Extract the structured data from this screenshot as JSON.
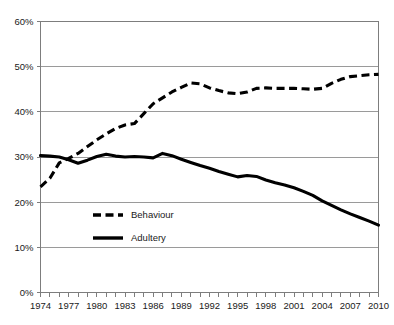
{
  "chart_data": {
    "type": "line",
    "title": "",
    "xlabel": "",
    "ylabel": "",
    "xlim": [
      1974,
      2010
    ],
    "ylim": [
      0,
      60
    ],
    "grid": true,
    "grid_axis": "y",
    "legend_position": "inside-lower-left",
    "x": [
      1974,
      1975,
      1976,
      1977,
      1978,
      1979,
      1980,
      1981,
      1982,
      1983,
      1984,
      1985,
      1986,
      1987,
      1988,
      1989,
      1990,
      1991,
      1992,
      1993,
      1994,
      1995,
      1996,
      1997,
      1998,
      1999,
      2000,
      2001,
      2002,
      2003,
      2004,
      2005,
      2006,
      2007,
      2008,
      2009,
      2010
    ],
    "series": [
      {
        "name": "Behaviour",
        "style": "dashed",
        "color": "#000000",
        "values": [
          23.4,
          25.3,
          28.7,
          29.7,
          30.8,
          32.3,
          33.8,
          35.1,
          36.3,
          37.1,
          37.4,
          39.6,
          41.8,
          43.1,
          44.4,
          45.4,
          46.4,
          46.2,
          45.3,
          44.7,
          44.2,
          44.0,
          44.4,
          45.2,
          45.3,
          45.2,
          45.2,
          45.2,
          45.1,
          45.0,
          45.2,
          46.3,
          47.2,
          47.8,
          48.0,
          48.2,
          48.3
        ]
      },
      {
        "name": "Adultery",
        "style": "solid",
        "color": "#000000",
        "values": [
          30.3,
          30.2,
          30.0,
          29.4,
          28.6,
          29.3,
          30.1,
          30.6,
          30.2,
          30.0,
          30.1,
          30.0,
          29.8,
          30.8,
          30.3,
          29.5,
          28.8,
          28.1,
          27.5,
          26.8,
          26.2,
          25.6,
          25.9,
          25.7,
          24.9,
          24.3,
          23.8,
          23.2,
          22.4,
          21.5,
          20.3,
          19.3,
          18.3,
          17.4,
          16.6,
          15.8,
          14.9
        ]
      }
    ],
    "yticks": [
      {
        "value": 0,
        "label": "0%"
      },
      {
        "value": 10,
        "label": "10%"
      },
      {
        "value": 20,
        "label": "20%"
      },
      {
        "value": 30,
        "label": "30%"
      },
      {
        "value": 40,
        "label": "40%"
      },
      {
        "value": 50,
        "label": "50%"
      },
      {
        "value": 60,
        "label": "60%"
      }
    ],
    "xticks_labeled": [
      {
        "value": 1974,
        "label": "1974"
      },
      {
        "value": 1977,
        "label": "1977"
      },
      {
        "value": 1980,
        "label": "1980"
      },
      {
        "value": 1983,
        "label": "1983"
      },
      {
        "value": 1986,
        "label": "1986"
      },
      {
        "value": 1989,
        "label": "1989"
      },
      {
        "value": 1992,
        "label": "1992"
      },
      {
        "value": 1995,
        "label": "1995"
      },
      {
        "value": 1998,
        "label": "1998"
      },
      {
        "value": 2001,
        "label": "2001"
      },
      {
        "value": 2004,
        "label": "2004"
      },
      {
        "value": 2007,
        "label": "2007"
      },
      {
        "value": 2010,
        "label": "2010"
      }
    ],
    "legend": [
      {
        "label": "Behaviour",
        "style": "dashed"
      },
      {
        "label": "Adultery",
        "style": "solid"
      }
    ]
  },
  "colors": {
    "series": "#000000",
    "gridline": "#9a9a9a",
    "axis": "#7d7d7d",
    "text": "#1a1a1a",
    "background": "#ffffff"
  }
}
